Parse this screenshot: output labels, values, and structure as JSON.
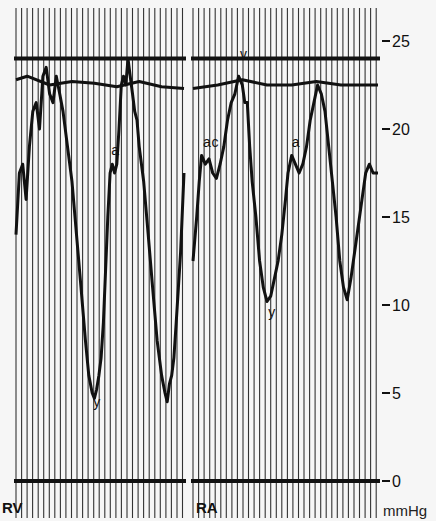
{
  "chart_data": {
    "type": "line",
    "title": "",
    "xlabel": "",
    "ylabel": "mmHg",
    "ylim": [
      0,
      25
    ],
    "y_ticks": [
      0,
      5,
      10,
      15,
      20,
      25
    ],
    "y_tick_labels": [
      "0",
      "5",
      "10",
      "15",
      "20",
      "25"
    ],
    "grid": "vertical time lines",
    "panels": [
      {
        "label": "RV",
        "series": [
          {
            "name": "RV pressure",
            "points": [
              [
                0,
                14
              ],
              [
                3,
                17.5
              ],
              [
                6,
                18
              ],
              [
                9,
                16
              ],
              [
                12,
                19
              ],
              [
                15,
                21
              ],
              [
                18,
                21.5
              ],
              [
                21,
                20
              ],
              [
                24,
                23
              ],
              [
                27,
                23.5
              ],
              [
                30,
                22
              ],
              [
                33,
                21.5
              ],
              [
                36,
                23
              ],
              [
                39,
                22
              ],
              [
                42,
                21
              ],
              [
                46,
                19
              ],
              [
                50,
                17
              ],
              [
                54,
                14
              ],
              [
                58,
                11
              ],
              [
                62,
                8
              ],
              [
                65,
                6
              ],
              [
                68,
                5
              ],
              [
                70,
                4.7
              ],
              [
                72,
                5.2
              ],
              [
                74,
                6
              ],
              [
                76,
                7
              ],
              [
                78,
                9
              ],
              [
                80,
                12
              ],
              [
                82,
                15
              ],
              [
                84,
                17.5
              ],
              [
                86,
                18
              ],
              [
                88,
                17.5
              ],
              [
                90,
                18
              ],
              [
                92,
                20
              ],
              [
                94,
                22.5
              ],
              [
                96,
                23
              ],
              [
                98,
                22.5
              ],
              [
                100,
                24
              ],
              [
                102,
                23
              ],
              [
                104,
                22
              ],
              [
                106,
                21
              ],
              [
                108,
                20.5
              ],
              [
                110,
                19
              ],
              [
                114,
                17
              ],
              [
                118,
                14
              ],
              [
                122,
                11
              ],
              [
                126,
                8
              ],
              [
                130,
                6
              ],
              [
                133,
                5
              ],
              [
                135,
                4.5
              ],
              [
                137,
                5.5
              ],
              [
                139,
                6
              ],
              [
                141,
                7
              ],
              [
                143,
                9
              ],
              [
                145,
                11
              ],
              [
                147,
                13
              ],
              [
                150,
                17.5
              ]
            ],
            "annotations": [
              {
                "text": "a",
                "x": 85,
                "y": 18.5
              },
              {
                "text": "y",
                "x": 69,
                "y": 4.2
              }
            ]
          },
          {
            "name": "reference line (upper)",
            "points": [
              [
                0,
                22.8
              ],
              [
                10,
                23
              ],
              [
                30,
                22.5
              ],
              [
                50,
                22.7
              ],
              [
                70,
                22.6
              ],
              [
                90,
                22.4
              ],
              [
                110,
                22.7
              ],
              [
                130,
                22.4
              ],
              [
                150,
                22.3
              ]
            ]
          }
        ]
      },
      {
        "label": "RA",
        "series": [
          {
            "name": "RA pressure",
            "points": [
              [
                0,
                12.5
              ],
              [
                3,
                15
              ],
              [
                5,
                17
              ],
              [
                7,
                18.5
              ],
              [
                10,
                18
              ],
              [
                13,
                18.3
              ],
              [
                16,
                17.5
              ],
              [
                19,
                17.2
              ],
              [
                22,
                18
              ],
              [
                25,
                19
              ],
              [
                28,
                20.5
              ],
              [
                31,
                21.5
              ],
              [
                34,
                22
              ],
              [
                37,
                23
              ],
              [
                40,
                22.5
              ],
              [
                42,
                21.5
              ],
              [
                44,
                21.5
              ],
              [
                46,
                19
              ],
              [
                48,
                17
              ],
              [
                51,
                15
              ],
              [
                54,
                12.5
              ],
              [
                57,
                11
              ],
              [
                60,
                10.2
              ],
              [
                63,
                10.5
              ],
              [
                66,
                11.5
              ],
              [
                69,
                12.5
              ],
              [
                72,
                14
              ],
              [
                75,
                16
              ],
              [
                77,
                17.5
              ],
              [
                80,
                18.5
              ],
              [
                83,
                18
              ],
              [
                86,
                17.5
              ],
              [
                89,
                18
              ],
              [
                92,
                19
              ],
              [
                95,
                20.5
              ],
              [
                98,
                21.5
              ],
              [
                101,
                22.5
              ],
              [
                104,
                22
              ],
              [
                107,
                21
              ],
              [
                110,
                19
              ],
              [
                113,
                17
              ],
              [
                116,
                15
              ],
              [
                119,
                12.5
              ],
              [
                122,
                11
              ],
              [
                125,
                10.3
              ],
              [
                128,
                11.5
              ],
              [
                131,
                13
              ],
              [
                134,
                14.5
              ],
              [
                137,
                16
              ],
              [
                140,
                17.5
              ],
              [
                143,
                18
              ],
              [
                146,
                17.5
              ],
              [
                150,
                17.5
              ]
            ],
            "annotations": [
              {
                "text": "a",
                "x": 8,
                "y": 19
              },
              {
                "text": "c",
                "x": 15,
                "y": 19
              },
              {
                "text": "v",
                "x": 38,
                "y": 24
              },
              {
                "text": "y",
                "x": 61,
                "y": 9.3
              },
              {
                "text": "a",
                "x": 80,
                "y": 19
              }
            ]
          },
          {
            "name": "reference line (upper)",
            "points": [
              [
                0,
                22.3
              ],
              [
                20,
                22.5
              ],
              [
                40,
                22.8
              ],
              [
                60,
                22.5
              ],
              [
                80,
                22.5
              ],
              [
                100,
                22.7
              ],
              [
                120,
                22.5
              ],
              [
                150,
                22.5
              ]
            ]
          }
        ]
      }
    ],
    "horizontal_lines": [
      {
        "value": 24,
        "style": "thick"
      },
      {
        "value": 0,
        "style": "thick"
      }
    ]
  },
  "axis": {
    "ticks": [
      {
        "label": "25",
        "value": 25
      },
      {
        "label": "20",
        "value": 20
      },
      {
        "label": "15",
        "value": 15
      },
      {
        "label": "10",
        "value": 10
      },
      {
        "label": "5",
        "value": 5
      },
      {
        "label": "0",
        "value": 0
      }
    ],
    "unit": "mmHg"
  },
  "panels": {
    "rv_label": "RV",
    "ra_label": "RA"
  },
  "colors": {
    "background": "#f6f6f6",
    "ink": "#111111",
    "grid": "#333333"
  }
}
